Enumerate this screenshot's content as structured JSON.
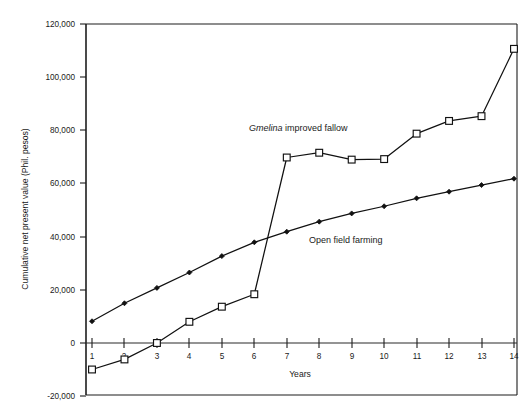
{
  "chart_data": {
    "type": "line",
    "title": "",
    "xlabel": "Years",
    "ylabel": "Cumulative net present value (Phil. pesos)",
    "x": [
      1,
      2,
      3,
      4,
      5,
      6,
      7,
      8,
      9,
      10,
      11,
      12,
      13,
      14
    ],
    "xtick_labels": [
      "1",
      "2",
      "3",
      "4",
      "5",
      "6",
      "7",
      "8",
      "9",
      "10",
      "11",
      "12",
      "13",
      "14"
    ],
    "ytick_labels": [
      "120,000",
      "100,000",
      "80,000",
      "60,000",
      "40,000",
      "20,000",
      "0",
      "-20,000"
    ],
    "ytick_values": [
      120000,
      100000,
      80000,
      60000,
      40000,
      20000,
      0,
      -20000
    ],
    "xlim": [
      0.6,
      14.4
    ],
    "ylim": [
      -20000,
      120000
    ],
    "grid": false,
    "legend_position": "inline-annotations",
    "zero_line": true,
    "series": [
      {
        "name": "Gmelina improved fallow",
        "name_italic_prefix": "Gmelina",
        "name_rest": " improved fallow",
        "marker": "open-square",
        "values": [
          -10000,
          -6200,
          0,
          8000,
          13700,
          18400,
          70000,
          71800,
          69200,
          69400,
          79000,
          83800,
          85600,
          111000
        ]
      },
      {
        "name": "Open field farming",
        "marker": "filled-diamond",
        "values": [
          8200,
          15000,
          20800,
          26600,
          32800,
          38000,
          42000,
          45800,
          48900,
          51600,
          54600,
          57100,
          59600,
          62000
        ]
      }
    ],
    "annotations": [
      {
        "text": "Gmelina improved fallow",
        "x": 7.2,
        "y": 88000
      },
      {
        "text": "Open field farming",
        "x": 9.1,
        "y": 35000
      }
    ]
  },
  "axis": {
    "y_title": "Cumulative net present value (Phil. pesos)",
    "x_title": "Years"
  }
}
